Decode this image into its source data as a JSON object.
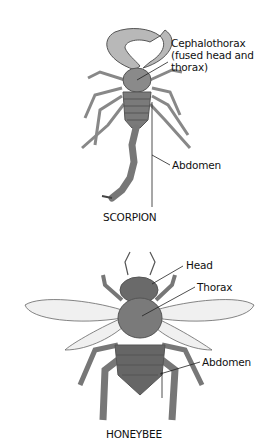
{
  "scorpion": {
    "title": "SCORPION",
    "labels": {
      "cephalothorax_line1": "Cephalothorax",
      "cephalothorax_line2": "(fused head and",
      "cephalothorax_line3": "thorax)",
      "abdomen": "Abdomen"
    }
  },
  "honeybee": {
    "title": "HONEYBEE",
    "labels": {
      "head": "Head",
      "thorax": "Thorax",
      "abdomen": "Abdomen"
    }
  }
}
